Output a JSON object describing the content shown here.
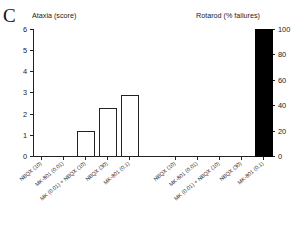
{
  "figure": {
    "panel_letter": "C"
  },
  "chart_data": {
    "type": "bar",
    "title": "",
    "panels": [
      {
        "name": "ataxia",
        "title": "Ataxia (score)",
        "ylabel": "Ataxia (score)",
        "xlabel": "",
        "ylim": [
          0,
          6
        ],
        "yticks": [
          0,
          1,
          2,
          3,
          4,
          5,
          6
        ],
        "ytick_labels": [
          "0",
          "1",
          "2",
          "3",
          "4",
          "5",
          "6"
        ],
        "axis_side": "left",
        "grid": false,
        "legend": "none",
        "bar_style": "open",
        "categories": [
          "NBQX (10)",
          "MK-801 (0.01)",
          "MK (0.01) + NBQX (10)",
          "NBQX (30)",
          "MK-801 (0.1)"
        ],
        "values": [
          0,
          0,
          1.2,
          2.25,
          2.9
        ]
      },
      {
        "name": "rotarod",
        "title": "Rotarod (% failures)",
        "ylabel": "Rotarod (% failures)",
        "xlabel": "",
        "ylim": [
          0,
          100
        ],
        "yticks": [
          0,
          20,
          40,
          60,
          80,
          100
        ],
        "ytick_labels": [
          "0",
          "20",
          "40",
          "60",
          "80",
          "100"
        ],
        "axis_side": "right",
        "grid": false,
        "legend": "none",
        "bar_style": "filled",
        "categories": [
          "NBQX (10)",
          "MK-801 (0.01)",
          "MK (0.01) + NBQX (10)",
          "NBQX (30)",
          "MK-801 (0.1)"
        ],
        "values": [
          0,
          0,
          0,
          0,
          100
        ]
      }
    ],
    "colors": {
      "bar_open_fill": "#ffffff",
      "bar_outline": "#222222",
      "bar_filled": "#000000",
      "axis": "#222222",
      "text": "#1a1a1a",
      "background": "#ffffff"
    }
  }
}
